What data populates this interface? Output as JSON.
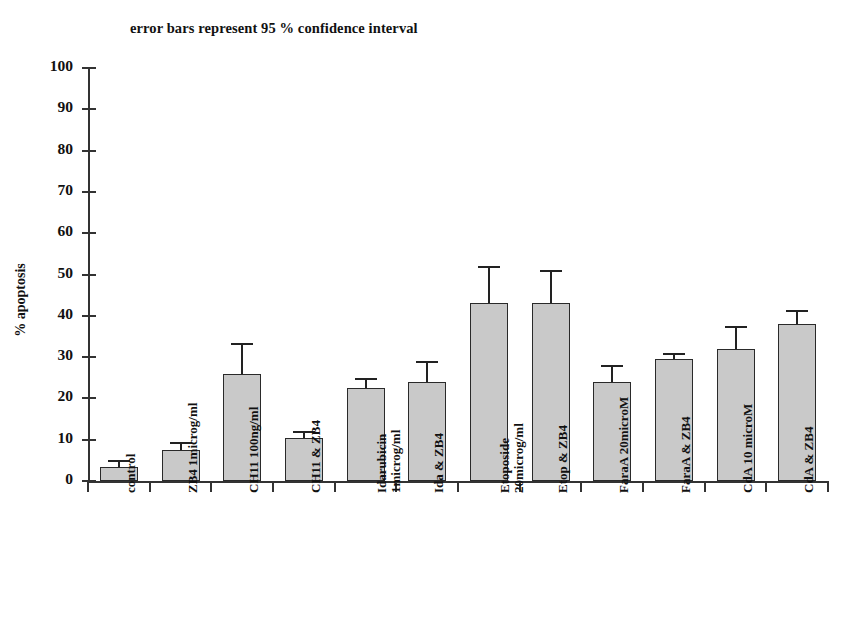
{
  "chart_data": {
    "type": "bar",
    "title": "error bars represent 95 % confidence interval",
    "xlabel": "",
    "ylabel": "% apoptosis",
    "ylim": [
      0,
      100
    ],
    "ytick_step": 10,
    "yticks": [
      "100",
      "90",
      "80",
      "70",
      "60",
      "50",
      "40",
      "30",
      "20",
      "10",
      "0"
    ],
    "grid": false,
    "legend": "none",
    "bar_fill_color": "#c9c9c9",
    "bar_border_color": "#2a2a2a",
    "error_bar_color": "#222222",
    "error_bar_note": "95% confidence interval",
    "categories": [
      "control",
      "ZB4 1microg/ml",
      "CH11 100ng/ml",
      "CH11 & ZB4",
      "Idarubicin 1microg/ml",
      "Ida & ZB4",
      "Etoposide 20microg/ml",
      "Etop & ZB4",
      "FaraA 20microM",
      "FaraA & ZB4",
      "CdA 10 microM",
      "CdA & ZB4"
    ],
    "category_lines": [
      [
        "control"
      ],
      [
        "ZB4 1microg/ml"
      ],
      [
        "CH11 100ng/ml"
      ],
      [
        "CH11 & ZB4"
      ],
      [
        "Idarubicin",
        "1microg/ml"
      ],
      [
        "Ida & ZB4"
      ],
      [
        "Etoposide",
        "20microg/ml"
      ],
      [
        "Etop & ZB4"
      ],
      [
        "FaraA 20microM"
      ],
      [
        "FaraA & ZB4"
      ],
      [
        "CdA 10 microM"
      ],
      [
        "CdA & ZB4"
      ]
    ],
    "values": [
      3.5,
      7.5,
      26,
      10.5,
      22.5,
      24,
      43,
      43,
      24,
      29.5,
      32,
      38
    ],
    "error_upper": [
      5,
      9.5,
      33.5,
      12,
      25,
      29,
      52,
      51,
      28,
      31,
      37.5,
      41.5
    ],
    "error_lower": [
      2,
      5.5,
      18.5,
      9,
      20,
      19,
      34,
      35,
      20,
      28,
      26.5,
      34.5
    ]
  }
}
